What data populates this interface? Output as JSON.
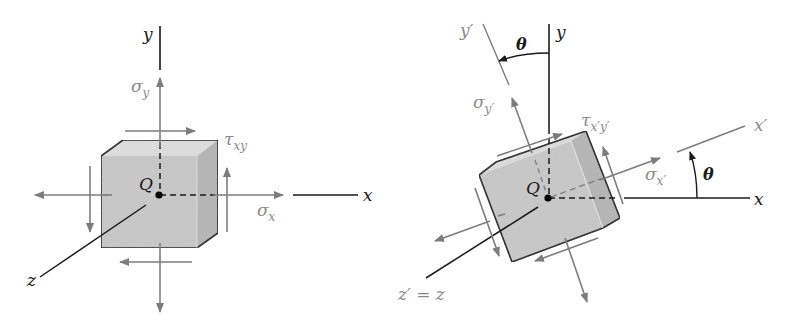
{
  "figure": {
    "left_panel": {
      "axes": {
        "y": "y",
        "x": "x",
        "z": "z"
      },
      "point": "Q",
      "stresses": {
        "sigma_y": {
          "symbol": "σ",
          "sub": "y"
        },
        "sigma_x": {
          "symbol": "σ",
          "sub": "x"
        },
        "tau_xy": {
          "symbol": "τ",
          "sub": "xy"
        }
      }
    },
    "right_panel": {
      "axes": {
        "y": "y",
        "x": "x",
        "y_prime": "y′",
        "x_prime": "x′",
        "z_prime_eq_z": "z′ = z"
      },
      "point": "Q",
      "angle_label_top": "θ",
      "angle_label_right": "θ",
      "stresses": {
        "sigma_yp": {
          "symbol": "σ",
          "sub": "y′"
        },
        "sigma_xp": {
          "symbol": "σ",
          "sub": "x′"
        },
        "tau_xpyp": {
          "symbol": "τ",
          "sub": "x′y′"
        }
      }
    },
    "colors": {
      "axis": "#1a1a1a",
      "stress_arrow": "#7d7d7d",
      "cube_front": "#c9c9c9",
      "cube_side": "#b3b3b3",
      "cube_top": "#dcdcdc",
      "label_gray": "#8a8a8a"
    }
  }
}
